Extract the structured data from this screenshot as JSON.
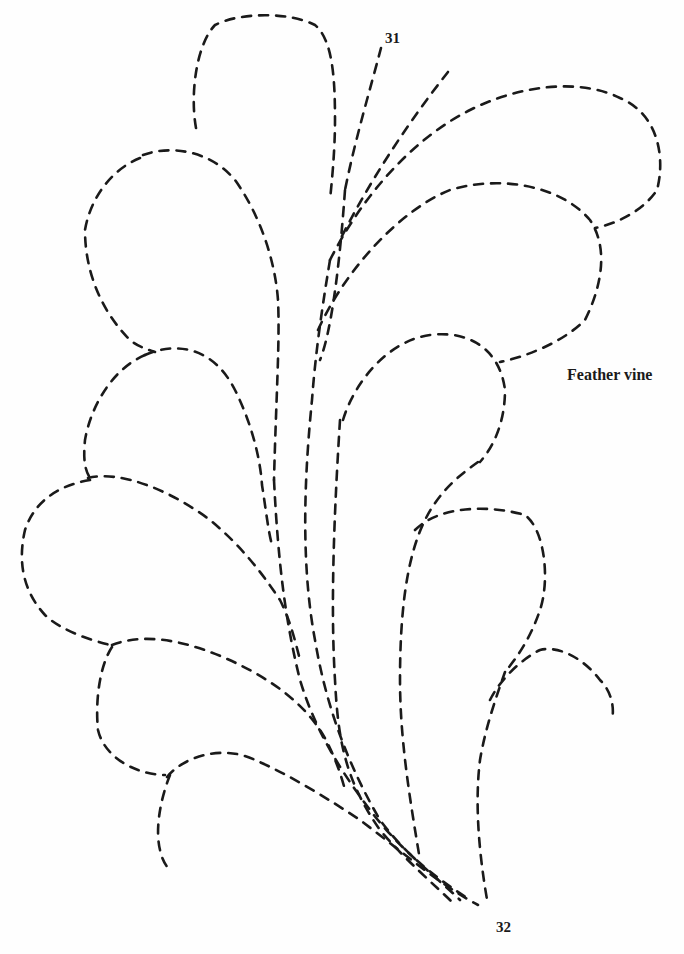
{
  "document": {
    "type": "quilting pattern page",
    "pattern_title": "Feather vine",
    "start_marker": "31",
    "end_marker": "32",
    "line_style": "dashed stitching line",
    "ink_color": "#1a1a1a",
    "background_color": "#fefefe"
  },
  "motif": {
    "description": "Dashed outline of a feather vine: a stem of curved spines fanning upward from point 32 to point 31 with rounded feather plumes on both sides",
    "elements": [
      {
        "name": "top-left-plume"
      },
      {
        "name": "upper-right-plume"
      },
      {
        "name": "middle-right-plume"
      },
      {
        "name": "left-plume-2"
      },
      {
        "name": "left-plume-3"
      },
      {
        "name": "left-plume-4"
      },
      {
        "name": "left-plume-5"
      },
      {
        "name": "lower-right-plume"
      },
      {
        "name": "lower-right-plume-2"
      },
      {
        "name": "small-curl-right"
      },
      {
        "name": "bottom-left-curl"
      },
      {
        "name": "central-spines"
      }
    ]
  }
}
